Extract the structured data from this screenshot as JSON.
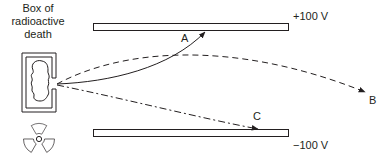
{
  "diagram": {
    "source_box": {
      "title_lines": [
        "Box of",
        "radioactive",
        "death"
      ]
    },
    "plates": {
      "top": {
        "voltage_label": "+100 V"
      },
      "bottom": {
        "voltage_label": "−100 V"
      }
    },
    "trajectories": [
      {
        "id": "A",
        "label": "A",
        "style": "solid",
        "end": "top-plate"
      },
      {
        "id": "B",
        "label": "B",
        "style": "dashed",
        "end": "exits-right"
      },
      {
        "id": "C",
        "label": "C",
        "style": "dash-dot",
        "end": "bottom-plate"
      }
    ],
    "icons": {
      "radiation": "radiation-trefoil-icon",
      "blob": "radioactive-sample-icon"
    },
    "colors": {
      "ink": "#231f20",
      "background": "#ffffff"
    }
  }
}
